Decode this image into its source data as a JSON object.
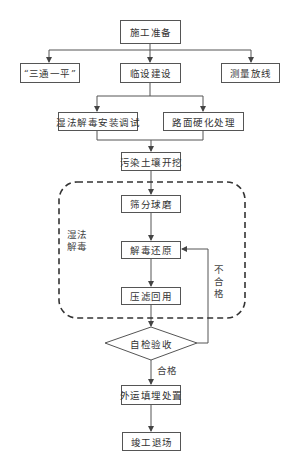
{
  "diagram": {
    "nodes": {
      "start": "施工准备",
      "three_one": "“三通一平”",
      "temp_facilities": "临设建设",
      "survey": "测量放线",
      "wet_install": "湿法解毒安装调试",
      "road_harden": "路面硬化处理",
      "excavation": "污染土壤开挖",
      "screening": "筛分球磨",
      "detox": "解毒还原",
      "filter_reuse": "压滤回用",
      "self_check": "自检验收",
      "landfill": "外运填埋处置",
      "finish": "竣工退场"
    },
    "group_label": "湿法解毒",
    "edge_labels": {
      "fail": "不合格",
      "pass": "合格"
    },
    "colors": {
      "line": "#555555",
      "text": "#333333",
      "background": "#ffffff"
    }
  }
}
